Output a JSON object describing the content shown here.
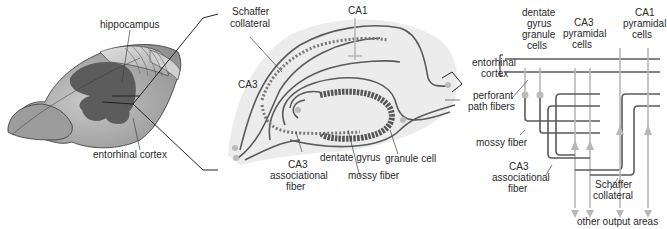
{
  "brain_panel": {
    "labels": {
      "hippocampus": "hippocampus",
      "entorhinal_cortex": "entorhinal cortex"
    }
  },
  "slice_panel": {
    "labels": {
      "ca1": "CA1",
      "ca3": "CA3",
      "schaffer_collateral_1": "Schaffer",
      "schaffer_collateral_2": "collateral",
      "entorhinal_1": "entorhinal",
      "entorhinal_2": "cortex",
      "perforant_1": "perforant",
      "perforant_2": "path fibers",
      "ca3_assoc_1": "CA3",
      "ca3_assoc_2": "associational",
      "ca3_assoc_3": "fiber",
      "dentate_gyrus": "dentate gyrus",
      "mossy_fiber": "mossy fiber",
      "granule_cell": "granule cell"
    }
  },
  "circuit_panel": {
    "labels": {
      "dg_1": "dentate",
      "dg_2": "gyrus",
      "dg_3": "granule",
      "dg_4": "cells",
      "ca3_1": "CA3",
      "ca3_2": "pyramidal",
      "ca3_3": "cells",
      "ca1_1": "CA1",
      "ca1_2": "pyramidal",
      "ca1_3": "cells",
      "mossy_fiber": "mossy fiber",
      "ca3_assoc_1": "CA3",
      "ca3_assoc_2": "associational",
      "ca3_assoc_3": "fiber",
      "schaffer_1": "Schaffer",
      "schaffer_2": "collateral",
      "output": "other output areas"
    }
  },
  "colors": {
    "background_blob": "#ececec",
    "dark_line": "#5a5a5a",
    "light_line": "#b8b8b8",
    "brain_light": "#b4b4b4",
    "brain_dark": "#5c5c5c"
  }
}
